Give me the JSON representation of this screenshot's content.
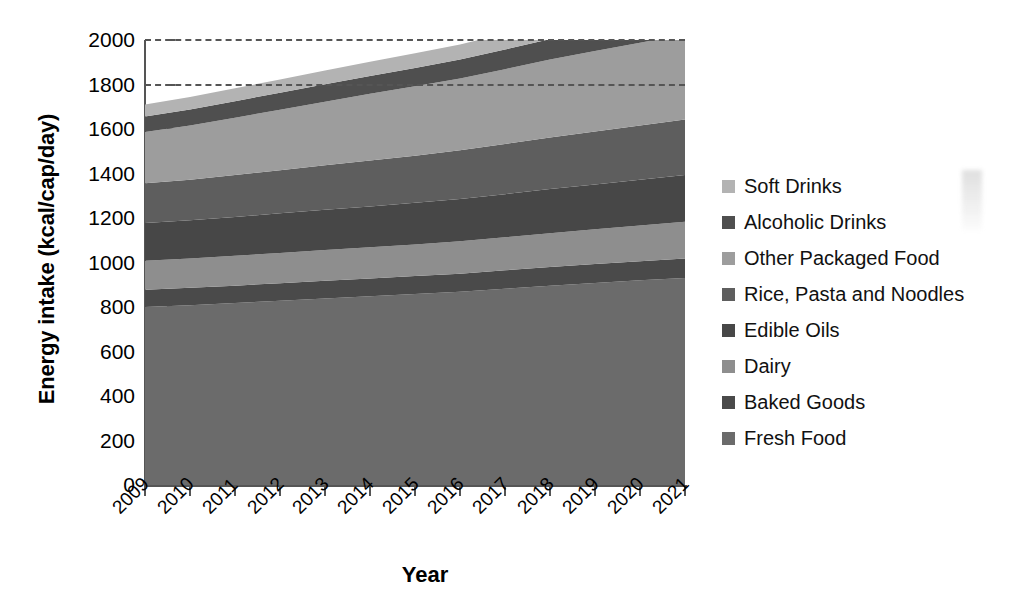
{
  "axes": {
    "y_title": "Energy intake (kcal/cap/day)",
    "x_title": "Year",
    "y_ticks": [
      "0",
      "200",
      "400",
      "600",
      "800",
      "1000",
      "1200",
      "1400",
      "1600",
      "1800",
      "2000"
    ],
    "x_ticks": [
      "2009",
      "2010",
      "2011",
      "2012",
      "2013",
      "2014",
      "2015",
      "2016",
      "2017",
      "2018",
      "2019",
      "2020",
      "2021"
    ]
  },
  "legend": {
    "items": [
      {
        "label": "Soft Drinks",
        "color": "#b3b3b3"
      },
      {
        "label": "Alcoholic Drinks",
        "color": "#4f4f4f"
      },
      {
        "label": "Other Packaged Food",
        "color": "#9d9d9d"
      },
      {
        "label": "Rice, Pasta and Noodles",
        "color": "#5e5e5e"
      },
      {
        "label": "Edible Oils",
        "color": "#474747"
      },
      {
        "label": "Dairy",
        "color": "#8e8e8e"
      },
      {
        "label": "Baked Goods",
        "color": "#4a4a4a"
      },
      {
        "label": "Fresh Food",
        "color": "#6b6b6b"
      }
    ]
  },
  "chart_data": {
    "type": "area",
    "title": "",
    "xlabel": "Year",
    "ylabel": "Energy intake (kcal/cap/day)",
    "ylim": [
      0,
      2000
    ],
    "grid": "dashed horizontal at 1800 and 2000",
    "legend_position": "right",
    "stacked": true,
    "stack_order_bottom_to_top": [
      "Fresh Food",
      "Baked Goods",
      "Dairy",
      "Edible Oils",
      "Rice, Pasta and Noodles",
      "Other Packaged Food",
      "Alcoholic Drinks",
      "Soft Drinks"
    ],
    "categories": [
      "2009",
      "2010",
      "2011",
      "2012",
      "2013",
      "2014",
      "2015",
      "2016",
      "2017",
      "2018",
      "2019",
      "2020",
      "2021"
    ],
    "series": [
      {
        "name": "Fresh Food",
        "color": "#6b6b6b",
        "values": [
          800,
          808,
          818,
          828,
          838,
          848,
          858,
          868,
          882,
          896,
          908,
          920,
          930
        ]
      },
      {
        "name": "Baked Goods",
        "color": "#4a4a4a",
        "values": [
          78,
          78,
          78,
          79,
          80,
          80,
          81,
          82,
          83,
          84,
          85,
          86,
          88
        ]
      },
      {
        "name": "Dairy",
        "color": "#8e8e8e",
        "values": [
          130,
          132,
          134,
          136,
          138,
          140,
          142,
          145,
          148,
          152,
          156,
          160,
          165
        ]
      },
      {
        "name": "Edible Oils",
        "color": "#474747",
        "values": [
          170,
          172,
          175,
          178,
          181,
          184,
          187,
          190,
          194,
          198,
          202,
          206,
          210
        ]
      },
      {
        "name": "Rice, Pasta and Noodles",
        "color": "#5e5e5e",
        "values": [
          178,
          182,
          188,
          194,
          200,
          206,
          212,
          220,
          226,
          232,
          238,
          244,
          250
        ]
      },
      {
        "name": "Other Packaged Food",
        "color": "#9d9d9d",
        "values": [
          230,
          244,
          258,
          272,
          286,
          300,
          312,
          322,
          336,
          350,
          362,
          372,
          382
        ]
      },
      {
        "name": "Alcoholic Drinks",
        "color": "#4f4f4f",
        "values": [
          70,
          72,
          74,
          76,
          78,
          80,
          82,
          85,
          88,
          92,
          95,
          98,
          100
        ]
      },
      {
        "name": "Soft Drinks",
        "color": "#b3b3b3",
        "values": [
          54,
          56,
          58,
          60,
          62,
          64,
          66,
          68,
          72,
          76,
          80,
          86,
          92
        ]
      }
    ],
    "cumulative_top_totals": [
      1710,
      1744,
      1783,
      1823,
      1863,
      1902,
      1940,
      1980,
      2029,
      2080,
      2126,
      2172,
      2217
    ]
  }
}
